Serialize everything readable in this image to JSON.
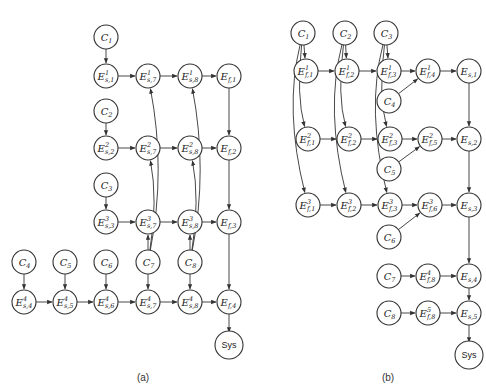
{
  "panels": [
    {
      "id": "a",
      "caption": "(a)",
      "caption_pos": [
        143,
        381
      ],
      "nodes": [
        {
          "id": "a_C1",
          "base": "C",
          "sub": "1",
          "x": 106,
          "y": 37
        },
        {
          "id": "a_E1s1",
          "base": "E",
          "sup": "1",
          "sub": "s,1",
          "x": 106,
          "y": 76
        },
        {
          "id": "a_E1s7",
          "base": "E",
          "sup": "1",
          "sub": "s,7",
          "x": 148,
          "y": 76
        },
        {
          "id": "a_E1s8",
          "base": "E",
          "sup": "1",
          "sub": "s,8",
          "x": 190,
          "y": 76
        },
        {
          "id": "a_Ef1",
          "base": "E",
          "sub": "f,1",
          "x": 229,
          "y": 76
        },
        {
          "id": "a_C2",
          "base": "C",
          "sub": "2",
          "x": 106,
          "y": 111
        },
        {
          "id": "a_E2s2",
          "base": "E",
          "sup": "2",
          "sub": "s,2",
          "x": 106,
          "y": 148
        },
        {
          "id": "a_E2s7",
          "base": "E",
          "sup": "2",
          "sub": "s,7",
          "x": 148,
          "y": 148
        },
        {
          "id": "a_E2s8",
          "base": "E",
          "sup": "2",
          "sub": "s,8",
          "x": 190,
          "y": 148
        },
        {
          "id": "a_Ef2",
          "base": "E",
          "sub": "f,2",
          "x": 229,
          "y": 148
        },
        {
          "id": "a_C3",
          "base": "C",
          "sub": "3",
          "x": 106,
          "y": 185
        },
        {
          "id": "a_E3s3",
          "base": "E",
          "sup": "3",
          "sub": "s,3",
          "x": 106,
          "y": 222
        },
        {
          "id": "a_E3s7",
          "base": "E",
          "sup": "3",
          "sub": "s,7",
          "x": 148,
          "y": 222
        },
        {
          "id": "a_E3s8",
          "base": "E",
          "sup": "3",
          "sub": "s,8",
          "x": 190,
          "y": 222
        },
        {
          "id": "a_Ef3",
          "base": "E",
          "sub": "f,3",
          "x": 229,
          "y": 222
        },
        {
          "id": "a_C4",
          "base": "C",
          "sub": "4",
          "x": 24,
          "y": 262
        },
        {
          "id": "a_C5",
          "base": "C",
          "sub": "5",
          "x": 65,
          "y": 262
        },
        {
          "id": "a_C6",
          "base": "C",
          "sub": "6",
          "x": 106,
          "y": 262
        },
        {
          "id": "a_C7",
          "base": "C",
          "sub": "7",
          "x": 148,
          "y": 262
        },
        {
          "id": "a_C8",
          "base": "C",
          "sub": "8",
          "x": 190,
          "y": 262
        },
        {
          "id": "a_E4s4",
          "base": "E",
          "sup": "4",
          "sub": "s,4",
          "x": 24,
          "y": 302
        },
        {
          "id": "a_E4s5",
          "base": "E",
          "sup": "4",
          "sub": "s,5",
          "x": 65,
          "y": 302
        },
        {
          "id": "a_E4s6",
          "base": "E",
          "sup": "4",
          "sub": "s,6",
          "x": 106,
          "y": 302
        },
        {
          "id": "a_E4s7",
          "base": "E",
          "sup": "4",
          "sub": "s,7",
          "x": 148,
          "y": 302
        },
        {
          "id": "a_E4s8",
          "base": "E",
          "sup": "4",
          "sub": "s,8",
          "x": 190,
          "y": 302
        },
        {
          "id": "a_Ef4",
          "base": "E",
          "sub": "f,4",
          "x": 229,
          "y": 302
        },
        {
          "id": "a_Sys",
          "base": "Sys",
          "x": 229,
          "y": 345
        }
      ],
      "edges": [
        {
          "from": "a_C1",
          "to": "a_E1s1"
        },
        {
          "from": "a_E1s1",
          "to": "a_E1s7"
        },
        {
          "from": "a_E1s7",
          "to": "a_E1s8"
        },
        {
          "from": "a_E1s8",
          "to": "a_Ef1"
        },
        {
          "from": "a_Ef1",
          "to": "a_Ef2"
        },
        {
          "from": "a_C2",
          "to": "a_E2s2"
        },
        {
          "from": "a_E2s2",
          "to": "a_E2s7"
        },
        {
          "from": "a_E2s7",
          "to": "a_E2s8"
        },
        {
          "from": "a_E2s8",
          "to": "a_Ef2"
        },
        {
          "from": "a_Ef2",
          "to": "a_Ef3"
        },
        {
          "from": "a_C3",
          "to": "a_E3s3"
        },
        {
          "from": "a_E3s3",
          "to": "a_E3s7"
        },
        {
          "from": "a_E3s7",
          "to": "a_E3s8"
        },
        {
          "from": "a_E3s8",
          "to": "a_Ef3"
        },
        {
          "from": "a_Ef3",
          "to": "a_Ef4"
        },
        {
          "from": "a_C4",
          "to": "a_E4s4"
        },
        {
          "from": "a_C5",
          "to": "a_E4s5"
        },
        {
          "from": "a_C6",
          "to": "a_E4s6"
        },
        {
          "from": "a_C7",
          "to": "a_E4s7"
        },
        {
          "from": "a_C8",
          "to": "a_E4s8"
        },
        {
          "from": "a_C7",
          "to": "a_E3s7"
        },
        {
          "from": "a_C8",
          "to": "a_E3s8"
        },
        {
          "from": "a_C7",
          "to": "a_E2s7",
          "curve": [
            158,
            200
          ]
        },
        {
          "from": "a_C7",
          "to": "a_E1s7",
          "curve": [
            166,
            170
          ]
        },
        {
          "from": "a_C8",
          "to": "a_E2s8",
          "curve": [
            200,
            200
          ]
        },
        {
          "from": "a_C8",
          "to": "a_E1s8",
          "curve": [
            208,
            170
          ]
        },
        {
          "from": "a_E4s4",
          "to": "a_E4s5"
        },
        {
          "from": "a_E4s5",
          "to": "a_E4s6"
        },
        {
          "from": "a_E4s6",
          "to": "a_E4s7"
        },
        {
          "from": "a_E4s7",
          "to": "a_E4s8"
        },
        {
          "from": "a_E4s8",
          "to": "a_Ef4"
        },
        {
          "from": "a_Ef4",
          "to": "a_Sys"
        }
      ]
    },
    {
      "id": "b",
      "caption": "(b)",
      "caption_pos": [
        388,
        381
      ],
      "nodes": [
        {
          "id": "b_C1",
          "base": "C",
          "sub": "1",
          "x": 303,
          "y": 33
        },
        {
          "id": "b_C2",
          "base": "C",
          "sub": "2",
          "x": 345,
          "y": 33
        },
        {
          "id": "b_C3",
          "base": "C",
          "sub": "3",
          "x": 386,
          "y": 33
        },
        {
          "id": "b_E1f1",
          "base": "E",
          "sup": "1",
          "sub": "f,1",
          "x": 306,
          "y": 71
        },
        {
          "id": "b_E1f2",
          "base": "E",
          "sup": "1",
          "sub": "f,2",
          "x": 347,
          "y": 71
        },
        {
          "id": "b_E1f3",
          "base": "E",
          "sup": "1",
          "sub": "f,3",
          "x": 389,
          "y": 71
        },
        {
          "id": "b_E1f4",
          "base": "E",
          "sup": "1",
          "sub": "f,4",
          "x": 428,
          "y": 71
        },
        {
          "id": "b_Es1",
          "base": "E",
          "sub": "s,1",
          "x": 469,
          "y": 71
        },
        {
          "id": "b_C4",
          "base": "C",
          "sub": "4",
          "x": 389,
          "y": 101
        },
        {
          "id": "b_E2f1",
          "base": "E",
          "sup": "2",
          "sub": "f,1",
          "x": 308,
          "y": 139
        },
        {
          "id": "b_E2f2",
          "base": "E",
          "sup": "2",
          "sub": "f,2",
          "x": 349,
          "y": 139
        },
        {
          "id": "b_E2f3",
          "base": "E",
          "sup": "2",
          "sub": "f,3",
          "x": 390,
          "y": 139
        },
        {
          "id": "b_E2f5",
          "base": "E",
          "sup": "2",
          "sub": "f,5",
          "x": 430,
          "y": 139
        },
        {
          "id": "b_Es2",
          "base": "E",
          "sub": "s,2",
          "x": 469,
          "y": 139
        },
        {
          "id": "b_C5",
          "base": "C",
          "sub": "5",
          "x": 389,
          "y": 169
        },
        {
          "id": "b_E3f1",
          "base": "E",
          "sup": "3",
          "sub": "f,1",
          "x": 308,
          "y": 205
        },
        {
          "id": "b_E3f2",
          "base": "E",
          "sup": "3",
          "sub": "f,2",
          "x": 349,
          "y": 205
        },
        {
          "id": "b_E3f3",
          "base": "E",
          "sup": "3",
          "sub": "f,3",
          "x": 390,
          "y": 205
        },
        {
          "id": "b_E3f6",
          "base": "E",
          "sup": "3",
          "sub": "f,6",
          "x": 430,
          "y": 205
        },
        {
          "id": "b_Es3",
          "base": "E",
          "sub": "s,3",
          "x": 469,
          "y": 205
        },
        {
          "id": "b_C6",
          "base": "C",
          "sub": "6",
          "x": 389,
          "y": 237
        },
        {
          "id": "b_C7",
          "base": "C",
          "sub": "7",
          "x": 389,
          "y": 276
        },
        {
          "id": "b_E4f8",
          "base": "E",
          "sup": "4",
          "sub": "f,8",
          "x": 428,
          "y": 276
        },
        {
          "id": "b_Es4",
          "base": "E",
          "sub": "s,4",
          "x": 469,
          "y": 276
        },
        {
          "id": "b_C8",
          "base": "C",
          "sub": "8",
          "x": 389,
          "y": 313
        },
        {
          "id": "b_E5f8",
          "base": "E",
          "sup": "5",
          "sub": "f,8",
          "x": 428,
          "y": 313
        },
        {
          "id": "b_Es5",
          "base": "E",
          "sub": "s,5",
          "x": 469,
          "y": 313
        },
        {
          "id": "b_Sys",
          "base": "Sys",
          "x": 469,
          "y": 355
        }
      ],
      "edges": [
        {
          "from": "b_C1",
          "to": "b_E1f1"
        },
        {
          "from": "b_C2",
          "to": "b_E1f2"
        },
        {
          "from": "b_C3",
          "to": "b_E1f3"
        },
        {
          "from": "b_C1",
          "to": "b_E2f1",
          "curve": [
            296,
            95
          ]
        },
        {
          "from": "b_C2",
          "to": "b_E2f2",
          "curve": [
            337,
            95
          ]
        },
        {
          "from": "b_C3",
          "to": "b_E2f3",
          "curve": [
            378,
            95
          ]
        },
        {
          "from": "b_C1",
          "to": "b_E3f1",
          "curve": [
            284,
            110
          ]
        },
        {
          "from": "b_C2",
          "to": "b_E3f2",
          "curve": [
            325,
            110
          ]
        },
        {
          "from": "b_C3",
          "to": "b_E3f3",
          "curve": [
            366,
            110
          ]
        },
        {
          "from": "b_E1f1",
          "to": "b_E1f2"
        },
        {
          "from": "b_E1f2",
          "to": "b_E1f3"
        },
        {
          "from": "b_E1f3",
          "to": "b_E1f4"
        },
        {
          "from": "b_C4",
          "to": "b_E1f4"
        },
        {
          "from": "b_E1f4",
          "to": "b_Es1"
        },
        {
          "from": "b_Es1",
          "to": "b_Es2"
        },
        {
          "from": "b_E2f1",
          "to": "b_E2f2"
        },
        {
          "from": "b_E2f2",
          "to": "b_E2f3"
        },
        {
          "from": "b_E2f3",
          "to": "b_E2f5"
        },
        {
          "from": "b_C5",
          "to": "b_E2f5"
        },
        {
          "from": "b_E2f5",
          "to": "b_Es2"
        },
        {
          "from": "b_Es2",
          "to": "b_Es3"
        },
        {
          "from": "b_E3f1",
          "to": "b_E3f2"
        },
        {
          "from": "b_E3f2",
          "to": "b_E3f3"
        },
        {
          "from": "b_E3f3",
          "to": "b_E3f6"
        },
        {
          "from": "b_C6",
          "to": "b_E3f6"
        },
        {
          "from": "b_E3f6",
          "to": "b_Es3"
        },
        {
          "from": "b_Es3",
          "to": "b_Es4"
        },
        {
          "from": "b_C7",
          "to": "b_E4f8"
        },
        {
          "from": "b_E4f8",
          "to": "b_Es4"
        },
        {
          "from": "b_Es4",
          "to": "b_Es5"
        },
        {
          "from": "b_C8",
          "to": "b_E5f8"
        },
        {
          "from": "b_E5f8",
          "to": "b_Es5"
        },
        {
          "from": "b_Es5",
          "to": "b_Sys"
        }
      ]
    }
  ],
  "style": {
    "node_radius": 12,
    "stroke_color": "#333333",
    "fill_color": "#ffffff"
  }
}
